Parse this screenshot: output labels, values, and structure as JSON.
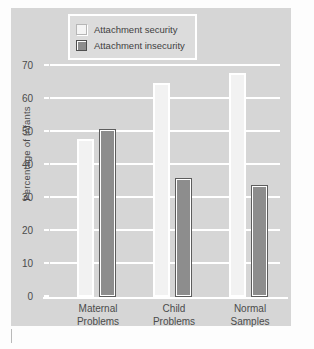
{
  "chart_data": {
    "type": "bar",
    "title": "",
    "xlabel": "",
    "ylabel": "Percentage of Infants",
    "categories": [
      "Maternal Problems",
      "Child Problems",
      "Normal Samples"
    ],
    "category_lines": [
      [
        "Maternal",
        "Problems"
      ],
      [
        "Child",
        "Problems"
      ],
      [
        "Normal",
        "Samples"
      ]
    ],
    "series": [
      {
        "name": "Attachment security",
        "values": [
          48,
          65,
          68
        ],
        "color": "#f2f2f2"
      },
      {
        "name": "Attachment insecurity",
        "values": [
          51,
          36,
          34
        ],
        "color": "#8d8d8d"
      }
    ],
    "ylim": [
      0,
      70
    ],
    "yticks": [
      0,
      10,
      20,
      30,
      40,
      50,
      60,
      70
    ],
    "ytick_labels": [
      "0",
      "10",
      "20",
      "30",
      "40",
      "50",
      "60",
      "70"
    ],
    "grid": true,
    "legend_position": "top-center"
  },
  "legend": {
    "items": [
      {
        "label": "Attachment security",
        "swatch": "white-square-icon"
      },
      {
        "label": "Attachment insecurity",
        "swatch": "gray-square-icon"
      }
    ]
  },
  "colors": {
    "panel_background": "#d6d6d6",
    "gridline": "#ffffff",
    "text": "#4b4b4b",
    "bar_security": "#f2f2f2",
    "bar_insecurity": "#8d8d8d",
    "bar_insecurity_outline": "#5d5d5d"
  }
}
